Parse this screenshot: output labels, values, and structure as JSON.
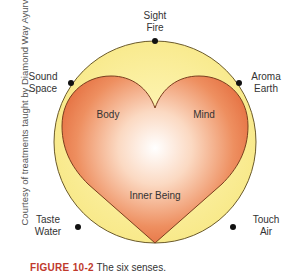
{
  "diagram": {
    "colors": {
      "circle_fill": "#f9ec8c",
      "circle_edge": "#6b5a2a",
      "heart_outer": "#e9784a",
      "heart_inner": "#ffffff",
      "dot": "#111111"
    },
    "senses": [
      {
        "sense": "Sight",
        "element": "Fire"
      },
      {
        "sense": "Sound",
        "element": "Space"
      },
      {
        "sense": "Aroma",
        "element": "Earth"
      },
      {
        "sense": "Taste",
        "element": "Water"
      },
      {
        "sense": "Touch",
        "element": "Air"
      }
    ],
    "heart_labels": {
      "left": "Body",
      "right": "Mind",
      "center": "Inner Being"
    }
  },
  "credit": "Courtesy of treatments taught by Diamond Way Ayurveda.",
  "caption": {
    "figure": "FIGURE 10-2",
    "text": "The six senses."
  }
}
